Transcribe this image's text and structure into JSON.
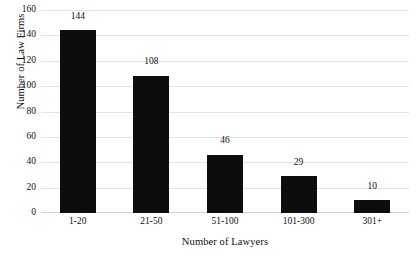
{
  "chart_data": {
    "type": "bar",
    "title": "",
    "subtitle": "",
    "categories": [
      "1-20",
      "21-50",
      "51-100",
      "101-300",
      "301+"
    ],
    "values": [
      144,
      108,
      46,
      29,
      10
    ],
    "xlabel": "Number of Lawyers",
    "ylabel": "Number of Law Firms",
    "ylim": [
      0,
      160
    ],
    "yticks": [
      0,
      20,
      40,
      60,
      80,
      100,
      120,
      140,
      160
    ],
    "ytick_labels": [
      "0",
      "20",
      "40",
      "60",
      "80",
      "100",
      "120",
      "140",
      "160"
    ],
    "data_labels": [
      "144",
      "108",
      "46",
      "29",
      "10"
    ],
    "grid": "horizontal",
    "legend": "none",
    "bar_color": "#0d0d0d",
    "grid_color": "#e2e2e2",
    "background_color": "#ffffff",
    "text_color": "#111111"
  }
}
